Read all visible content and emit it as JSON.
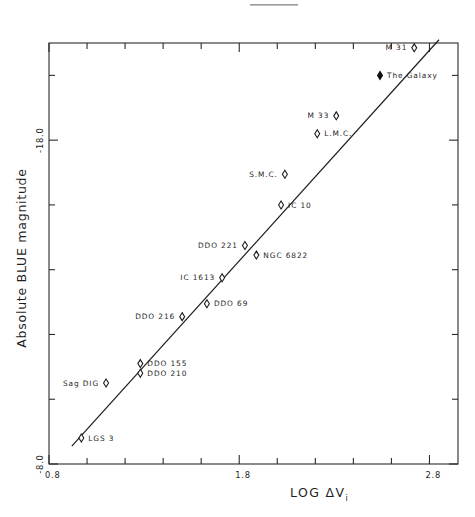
{
  "figure": {
    "caption_mark": "",
    "background": "#ffffff",
    "ink": "#1d1d1d"
  },
  "chart_data": {
    "type": "scatter",
    "title": "",
    "xlabel": "LOG ΔV",
    "xlabel_sub": "i",
    "ylabel": "Absolute BLUE magnitude",
    "xlim": [
      0.8,
      2.95
    ],
    "ylim": [
      -8.0,
      -21.0
    ],
    "xticks": [
      0.8,
      1.8,
      2.8
    ],
    "xticklabels": [
      "0.8",
      "1.8",
      "2.8"
    ],
    "xminor_count": 4,
    "yticks": [
      -8.0,
      -18.0
    ],
    "yticklabels": [
      "-8.0",
      "-18.0"
    ],
    "grid": false,
    "legend": "none",
    "fit_line": {
      "label": "linear fit",
      "x_start": 0.92,
      "y_start": -8.55,
      "x_end": 2.85,
      "y_end": -21.1
    },
    "points": [
      {
        "name": "M 31",
        "x": 2.72,
        "y": -20.85,
        "marker": "open",
        "label_side": "left"
      },
      {
        "name": "The Galaxy",
        "x": 2.54,
        "y": -20.0,
        "marker": "filled",
        "label_side": "right"
      },
      {
        "name": "M 33",
        "x": 2.31,
        "y": -18.75,
        "marker": "open",
        "label_side": "left"
      },
      {
        "name": "L.M.C.",
        "x": 2.21,
        "y": -18.2,
        "marker": "open",
        "label_side": "right"
      },
      {
        "name": "S.M.C.",
        "x": 2.04,
        "y": -16.95,
        "marker": "open",
        "label_side": "left"
      },
      {
        "name": "IC 10",
        "x": 2.02,
        "y": -16.0,
        "marker": "open",
        "label_side": "right"
      },
      {
        "name": "DDO 221",
        "x": 1.83,
        "y": -14.75,
        "marker": "open",
        "label_side": "left"
      },
      {
        "name": "NGC 6822",
        "x": 1.89,
        "y": -14.45,
        "marker": "open",
        "label_side": "right"
      },
      {
        "name": "IC 1613",
        "x": 1.71,
        "y": -13.75,
        "marker": "open",
        "label_side": "left"
      },
      {
        "name": "DDO 69",
        "x": 1.63,
        "y": -12.95,
        "marker": "open",
        "label_side": "right"
      },
      {
        "name": "DDO 216",
        "x": 1.5,
        "y": -12.55,
        "marker": "open",
        "label_side": "left"
      },
      {
        "name": "DDO 155",
        "x": 1.28,
        "y": -11.1,
        "marker": "open",
        "label_side": "right"
      },
      {
        "name": "DDO 210",
        "x": 1.28,
        "y": -10.8,
        "marker": "open",
        "label_side": "right"
      },
      {
        "name": "Sag DIG",
        "x": 1.1,
        "y": -10.5,
        "marker": "open",
        "label_side": "left"
      },
      {
        "name": "LGS 3",
        "x": 0.97,
        "y": -8.8,
        "marker": "open",
        "label_side": "right"
      }
    ]
  },
  "geometry": {
    "plot_left": 49,
    "plot_right": 458,
    "plot_top": 43,
    "plot_bottom": 464
  }
}
